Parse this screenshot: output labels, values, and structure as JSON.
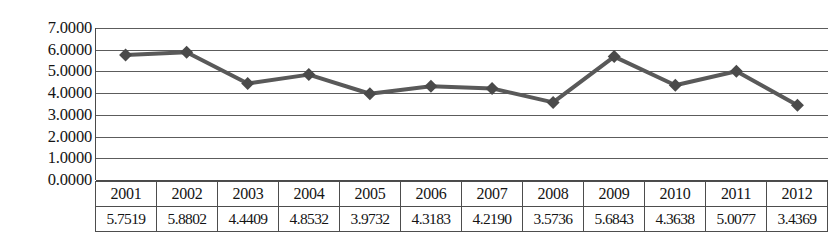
{
  "chart_data": {
    "type": "line",
    "title": "",
    "subtitle": "",
    "xlabel": "",
    "ylabel": "",
    "categories": [
      "2001",
      "2002",
      "2003",
      "2004",
      "2005",
      "2006",
      "2007",
      "2008",
      "2009",
      "2010",
      "2011",
      "2012"
    ],
    "values": [
      5.7519,
      5.8802,
      4.4409,
      4.8532,
      3.9732,
      4.3183,
      4.219,
      3.5736,
      5.6843,
      4.3638,
      5.0077,
      3.4369
    ],
    "series": [
      {
        "name": "",
        "values": [
          5.7519,
          5.8802,
          4.4409,
          4.8532,
          3.9732,
          4.3183,
          4.219,
          3.5736,
          5.6843,
          4.3638,
          5.0077,
          3.4369
        ]
      }
    ],
    "ylim": [
      0.0,
      7.0
    ],
    "ytick_step": 1.0,
    "ytick_labels": [
      "7.0000",
      "6.0000",
      "5.0000",
      "4.0000",
      "3.0000",
      "2.0000",
      "1.0000",
      "0.0000"
    ],
    "ytick_values": [
      7.0,
      6.0,
      5.0,
      4.0,
      3.0,
      2.0,
      1.0,
      0.0
    ],
    "grid": true,
    "legend": false,
    "legend_position": "none",
    "marker": "diamond",
    "line_color": "#595959",
    "marker_color": "#4a4a4a",
    "gridline_color": "#5c5c5c",
    "annotations": []
  },
  "table": {
    "header_row": [
      "2001",
      "2002",
      "2003",
      "2004",
      "2005",
      "2006",
      "2007",
      "2008",
      "2009",
      "2010",
      "2011",
      "2012"
    ],
    "values_row": [
      "5.7519",
      "5.8802",
      "4.4409",
      "4.8532",
      "3.9732",
      "4.3183",
      "4.2190",
      "3.5736",
      "5.6843",
      "4.3638",
      "5.0077",
      "3.4369"
    ]
  }
}
